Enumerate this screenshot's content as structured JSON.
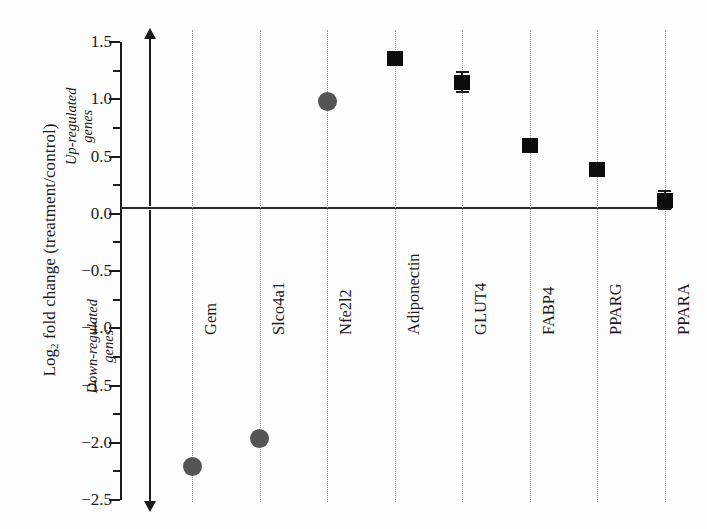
{
  "chart_data": {
    "type": "scatter",
    "title": "",
    "xlabel": "",
    "ylabel": "Log2 fold change (treatment/control)",
    "ylabel_parts": {
      "prefix": "Log",
      "sub": "2",
      "suffix": " fold change (treatment/control)"
    },
    "ylim": [
      -2.5,
      1.5
    ],
    "ytick_labels": [
      "1.5",
      "1.0",
      "0.5",
      "0.0",
      "-0.5",
      "-1.0",
      "-1.5",
      "-2.0",
      "-2.5"
    ],
    "ytick_values": [
      1.5,
      1.0,
      0.5,
      0.0,
      -0.5,
      -1.0,
      -1.5,
      -2.0,
      -2.5
    ],
    "yminor_values": [
      1.25,
      0.75,
      0.25,
      -0.25,
      -0.75,
      -1.25,
      -1.75,
      -2.25
    ],
    "grid": "vertical-dotted-per-category",
    "zero_reference_line": 0.0,
    "legend": "none",
    "categories": [
      "Gem",
      "Slco4a1",
      "Nfe2l2",
      "Adiponectin",
      "GLUT4",
      "FABP4",
      "PPARG",
      "PPARA"
    ],
    "values": [
      -2.21,
      -1.96,
      0.98,
      1.36,
      1.15,
      0.6,
      0.39,
      0.12
    ],
    "errors": [
      0.0,
      0.0,
      0.0,
      0.03,
      0.09,
      0.05,
      0.0,
      0.08
    ],
    "marker_shapes": [
      "circle",
      "circle",
      "circle",
      "square",
      "square",
      "square",
      "square",
      "square"
    ],
    "points": [
      {
        "label": "Gem",
        "value": -2.21,
        "error": 0.0,
        "shape": "circle",
        "color": "#555555"
      },
      {
        "label": "Slco4a1",
        "value": -1.96,
        "error": 0.0,
        "shape": "circle",
        "color": "#555555"
      },
      {
        "label": "Nfe2l2",
        "value": 0.98,
        "error": 0.0,
        "shape": "circle",
        "color": "#555555"
      },
      {
        "label": "Adiponectin",
        "value": 1.36,
        "error": 0.03,
        "shape": "square",
        "color": "#0d0d0d"
      },
      {
        "label": "GLUT4",
        "value": 1.15,
        "error": 0.09,
        "shape": "square",
        "color": "#0d0d0d"
      },
      {
        "label": "FABP4",
        "value": 0.6,
        "error": 0.05,
        "shape": "square",
        "color": "#0d0d0d"
      },
      {
        "label": "PPARG",
        "value": 0.39,
        "error": 0.0,
        "shape": "square",
        "color": "#0d0d0d"
      },
      {
        "label": "PPARA",
        "value": 0.12,
        "error": 0.08,
        "shape": "square",
        "color": "#0d0d0d"
      }
    ],
    "annotations": [
      {
        "name": "up-regulated",
        "line1": "Up-regulated",
        "line2": "genes",
        "direction": "up"
      },
      {
        "name": "down-regulated",
        "line1": "Down-regulated",
        "line2": "genes",
        "direction": "down"
      }
    ],
    "colors": {
      "axis": "#1b1b1b",
      "square_marker": "#0d0d0d",
      "circle_marker": "#555555",
      "gridline": "#9a9a9a",
      "background": "#fdfdfd"
    }
  }
}
